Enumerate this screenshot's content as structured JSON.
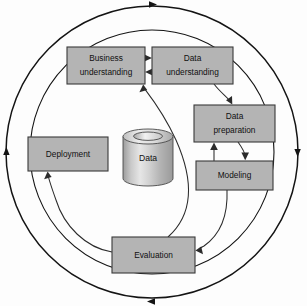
{
  "diagram": {
    "type": "cycle-diagram",
    "canvas": {
      "width": 307,
      "height": 306
    },
    "colors": {
      "box_fill": "#b4b4b4",
      "box_stroke": "#3a3a3a",
      "ring_stroke": "#141414",
      "link_stroke": "#2b2b2b",
      "background": "#fdfdfd",
      "cylinder_light": "#e8e8e8",
      "cylinder_dark": "#9a9a9a",
      "text": "#101010"
    },
    "outer_ring": {
      "name": "outer-cycle-ring",
      "center_x": 152,
      "center_y": 152,
      "radius": 146,
      "direction": "clockwise",
      "arrowheads": [
        "top",
        "right",
        "bottom",
        "left"
      ]
    },
    "inner_ring": {
      "name": "inner-cycle-ring",
      "center_x": 152,
      "center_y": 152,
      "radius": 122
    },
    "nodes": [
      {
        "id": "business-understanding",
        "label_line1": "Business",
        "label_line2": "understanding",
        "x": 67,
        "y": 47,
        "w": 78,
        "h": 37
      },
      {
        "id": "data-understanding",
        "label_line1": "Data",
        "label_line2": "understanding",
        "x": 152,
        "y": 47,
        "w": 81,
        "h": 37
      },
      {
        "id": "data-preparation",
        "label_line1": "Data",
        "label_line2": "preparation",
        "x": 194,
        "y": 105,
        "w": 81,
        "h": 37
      },
      {
        "id": "modeling",
        "label_line1": "Modeling",
        "label_line2": "",
        "x": 196,
        "y": 161,
        "w": 77,
        "h": 29
      },
      {
        "id": "deployment",
        "label_line1": "Deployment",
        "label_line2": "",
        "x": 28,
        "y": 137,
        "w": 80,
        "h": 34
      },
      {
        "id": "evaluation",
        "label_line1": "Evaluation",
        "label_line2": "",
        "x": 112,
        "y": 237,
        "w": 83,
        "h": 36
      }
    ],
    "datastore": {
      "id": "data-cylinder",
      "label": "Data",
      "cx": 148,
      "top_y": 129,
      "bottom_y": 186,
      "rx": 25,
      "ry": 7.5
    },
    "edges": [
      {
        "id": "business-to-data-understanding",
        "from": "business-understanding",
        "to": "data-understanding",
        "style": "straight",
        "direction": "forward"
      },
      {
        "id": "data-to-business-understanding",
        "from": "data-understanding",
        "to": "business-understanding",
        "style": "straight",
        "direction": "forward"
      },
      {
        "id": "data-understanding-to-data-preparation",
        "from": "data-understanding",
        "to": "data-preparation",
        "style": "curved",
        "direction": "forward"
      },
      {
        "id": "modeling-to-data-preparation",
        "from": "modeling",
        "to": "data-preparation",
        "style": "straight",
        "direction": "forward"
      },
      {
        "id": "data-preparation-to-modeling",
        "from": "data-preparation",
        "to": "modeling",
        "style": "curved",
        "direction": "forward"
      },
      {
        "id": "modeling-to-evaluation",
        "from": "modeling",
        "to": "evaluation",
        "style": "curved",
        "direction": "forward"
      },
      {
        "id": "evaluation-to-business-understanding",
        "from": "evaluation",
        "to": "business-understanding",
        "style": "curved",
        "direction": "forward"
      },
      {
        "id": "evaluation-to-deployment",
        "from": "evaluation",
        "to": "deployment",
        "style": "curved",
        "direction": "forward"
      }
    ]
  }
}
